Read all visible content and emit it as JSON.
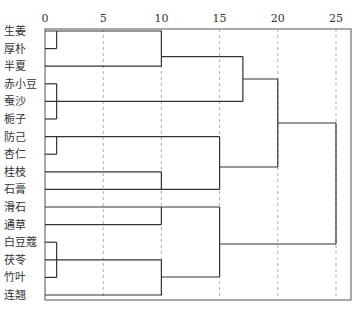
{
  "chart_data": {
    "type": "dendrogram",
    "title": "",
    "xlabel": "",
    "ylabel": "",
    "xlim": [
      0,
      25
    ],
    "x_ticks": [
      0,
      5,
      10,
      15,
      20,
      25
    ],
    "grid": "vertical dashed at each tick",
    "leaves": [
      "生姜",
      "厚朴",
      "半夏",
      "赤小豆",
      "蚕沙",
      "栀子",
      "防己",
      "杏仁",
      "桂枝",
      "石膏",
      "滑石",
      "通草",
      "白豆蔻",
      "茯苓",
      "竹叶",
      "连翘"
    ],
    "merges": [
      {
        "members": [
          "生姜",
          "厚朴"
        ],
        "distance": 1
      },
      {
        "members": [
          "生姜",
          "厚朴",
          "半夏"
        ],
        "distance": 10
      },
      {
        "members": [
          "赤小豆",
          "蚕沙",
          "栀子"
        ],
        "distance": 1
      },
      {
        "members": [
          "生姜",
          "厚朴",
          "半夏",
          "赤小豆",
          "蚕沙",
          "栀子"
        ],
        "distance": 17
      },
      {
        "members": [
          "防己",
          "杏仁"
        ],
        "distance": 1
      },
      {
        "members": [
          "桂枝",
          "石膏"
        ],
        "distance": 10
      },
      {
        "members": [
          "防己",
          "杏仁",
          "桂枝",
          "石膏"
        ],
        "distance": 15
      },
      {
        "members": [
          "生姜",
          "厚朴",
          "半夏",
          "赤小豆",
          "蚕沙",
          "栀子",
          "防己",
          "杏仁",
          "桂枝",
          "石膏"
        ],
        "distance": 20
      },
      {
        "members": [
          "滑石",
          "通草"
        ],
        "distance": 10
      },
      {
        "members": [
          "白豆蔻",
          "茯苓",
          "竹叶"
        ],
        "distance": 1
      },
      {
        "members": [
          "白豆蔻",
          "茯苓",
          "竹叶",
          "连翘"
        ],
        "distance": 10
      },
      {
        "members": [
          "滑石",
          "通草",
          "白豆蔻",
          "茯苓",
          "竹叶",
          "连翘"
        ],
        "distance": 15
      },
      {
        "members": [
          "ALL"
        ],
        "distance": 25
      }
    ]
  },
  "colors": {
    "line": "#333333",
    "grid": "#999999",
    "frame": "#555555"
  }
}
